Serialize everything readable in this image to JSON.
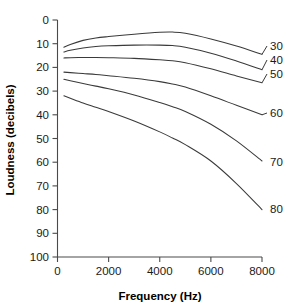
{
  "chart_data": {
    "type": "line",
    "title": "",
    "xlabel": "Frequency (Hz)",
    "ylabel": "Loudness (decibels)",
    "xlim": [
      0,
      8000
    ],
    "ylim": [
      0,
      100
    ],
    "y_inverted": true,
    "grid": false,
    "legend_position": "right-of-plot-inline-labels",
    "xticks": [
      0,
      2000,
      4000,
      6000,
      8000
    ],
    "xtick_labels": [
      "0",
      "2000",
      "4000",
      "6000",
      "8000"
    ],
    "yticks": [
      0,
      10,
      20,
      30,
      40,
      50,
      60,
      70,
      80,
      90,
      100
    ],
    "ytick_labels": [
      "0",
      "10",
      "20",
      "30",
      "40",
      "50",
      "60",
      "70",
      "80",
      "90",
      "100"
    ],
    "x": [
      250,
      500,
      1000,
      1500,
      2000,
      3000,
      4000,
      4500,
      5000,
      6000,
      7000,
      8000
    ],
    "series": [
      {
        "name": "30",
        "label": "30",
        "values": [
          11.5,
          10.3,
          8.6,
          7.6,
          7.0,
          6.0,
          5.2,
          5.1,
          5.6,
          8.0,
          11.0,
          14.5
        ]
      },
      {
        "name": "40",
        "label": "40",
        "values": [
          13.5,
          12.8,
          11.8,
          11.2,
          10.9,
          10.6,
          10.6,
          10.8,
          11.5,
          14.0,
          17.3,
          21.0
        ]
      },
      {
        "name": "50",
        "label": "50",
        "values": [
          16.0,
          15.9,
          15.8,
          15.8,
          15.9,
          16.2,
          16.8,
          17.2,
          18.0,
          20.6,
          23.6,
          26.5
        ]
      },
      {
        "name": "60",
        "label": "60",
        "values": [
          22.0,
          22.2,
          22.6,
          23.0,
          23.5,
          24.6,
          26.0,
          27.0,
          28.3,
          32.0,
          36.0,
          40.0
        ]
      },
      {
        "name": "70",
        "label": "70",
        "values": [
          25.0,
          25.6,
          26.8,
          27.9,
          29.0,
          31.6,
          34.8,
          36.6,
          38.6,
          44.0,
          51.0,
          59.5
        ]
      },
      {
        "name": "80",
        "label": "80",
        "values": [
          32.0,
          33.0,
          35.0,
          36.8,
          38.6,
          42.6,
          47.2,
          49.8,
          52.6,
          59.5,
          69.0,
          80.0
        ]
      }
    ],
    "curve_labels": [
      {
        "text": "30",
        "at_x": 8000,
        "at_y": 14.5
      },
      {
        "text": "40",
        "at_x": 8000,
        "at_y": 21.0
      },
      {
        "text": "50",
        "at_x": 8000,
        "at_y": 26.5
      },
      {
        "text": "60",
        "at_x": 8000,
        "at_y": 40.0
      },
      {
        "text": "70",
        "at_x": 8000,
        "at_y": 59.5
      },
      {
        "text": "80",
        "at_x": 8000,
        "at_y": 80.0
      }
    ],
    "colors": {
      "curve": "#3a3a3a",
      "axis": "#4a4a4a",
      "text": "#1a1a1a",
      "background": "#ffffff"
    }
  }
}
